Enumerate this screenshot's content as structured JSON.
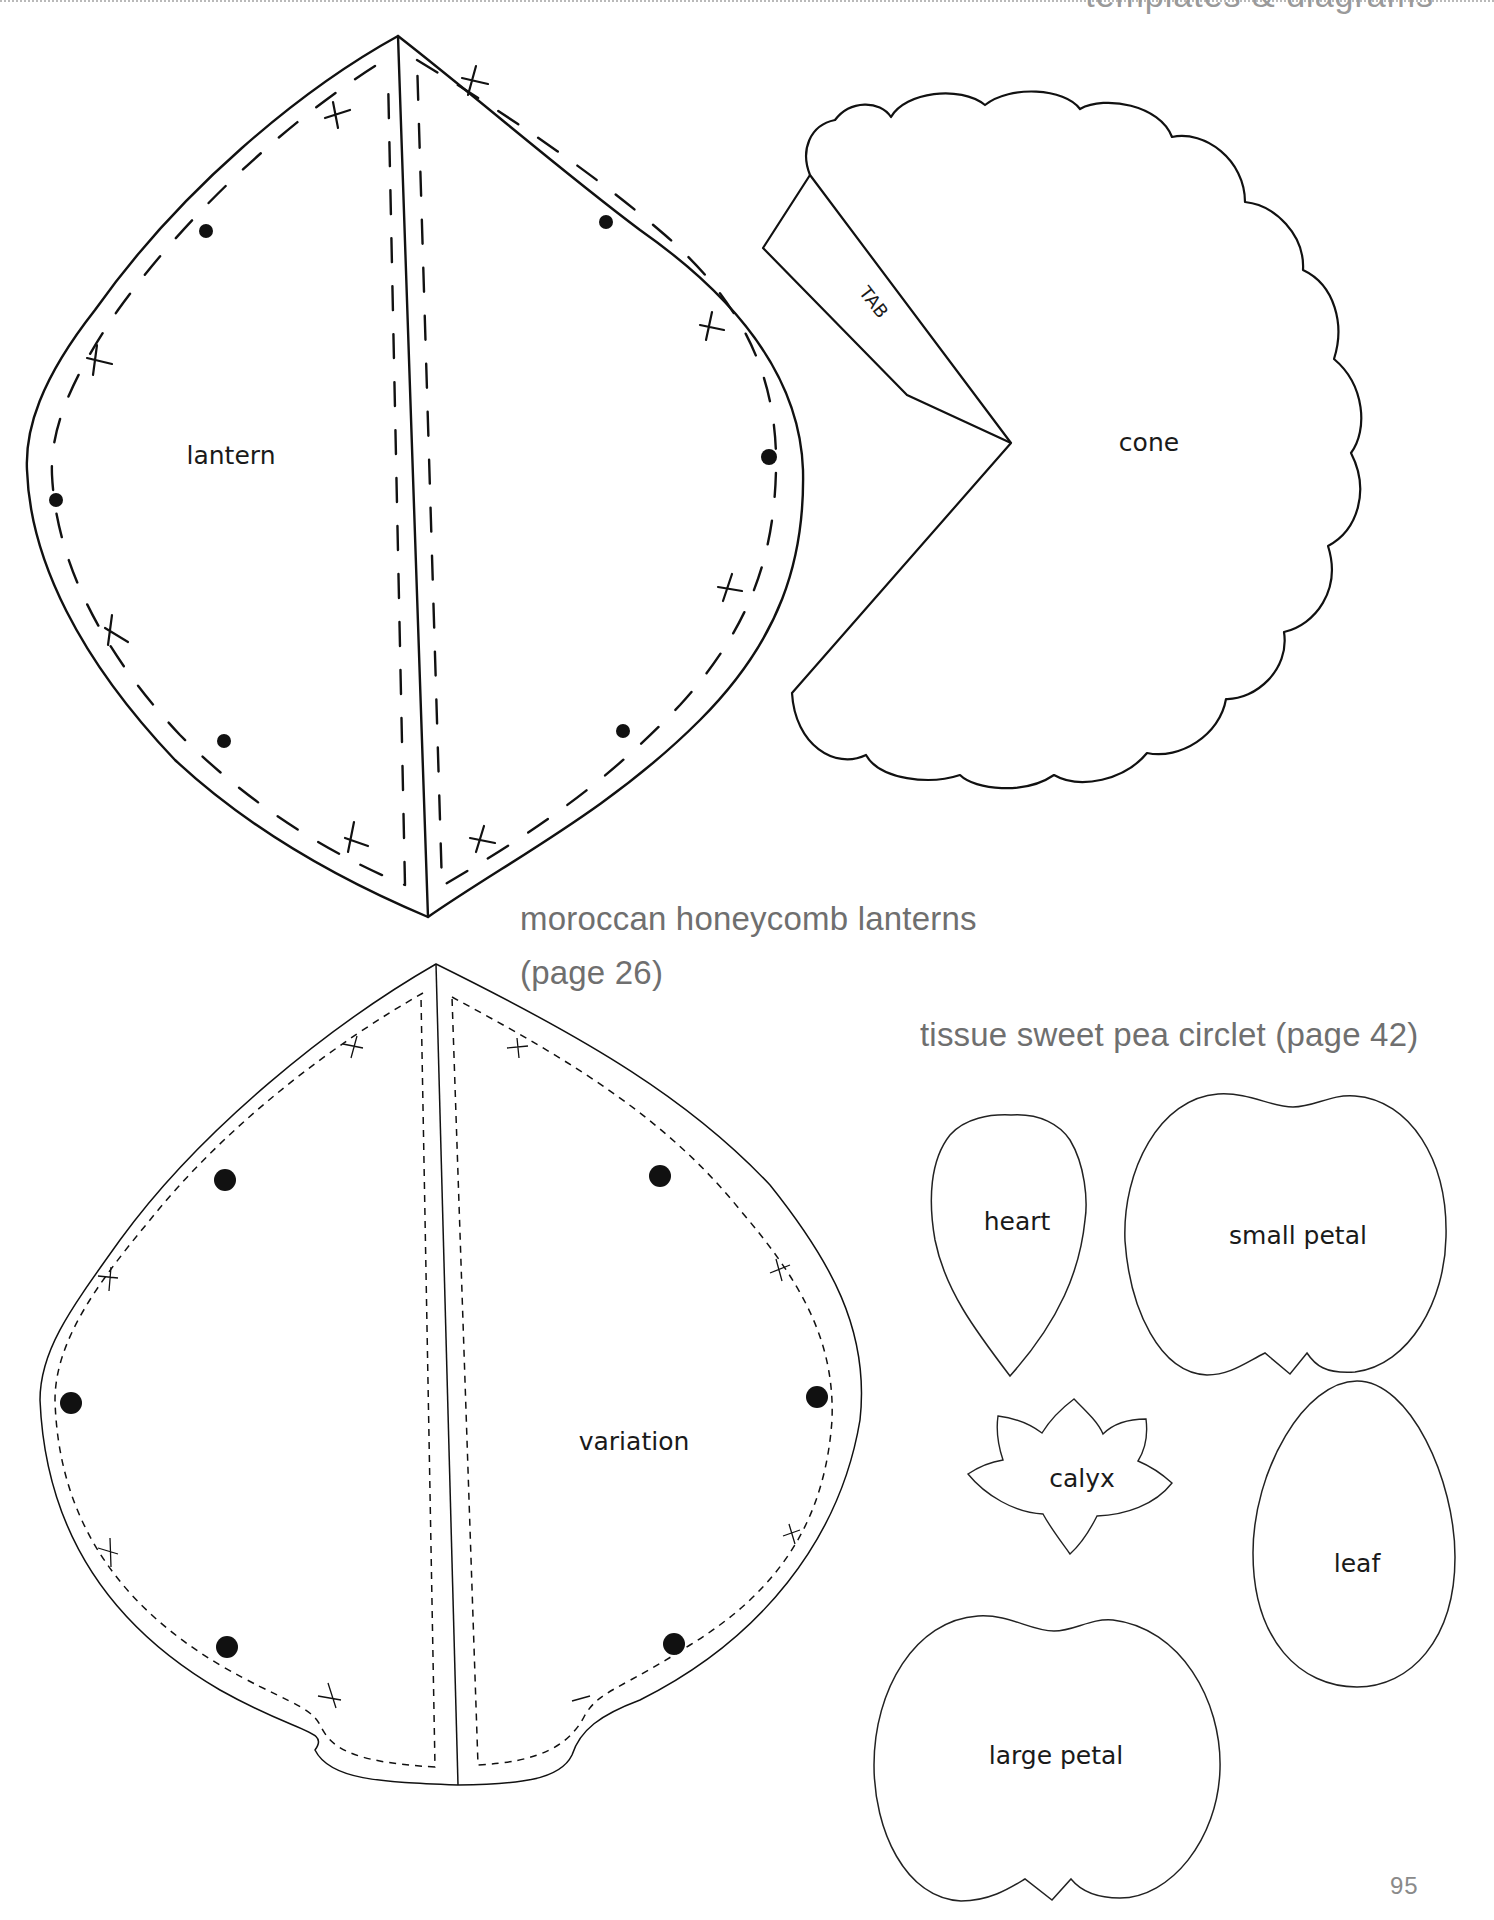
{
  "page": {
    "running_header": "templates & diagrams",
    "page_number": "95"
  },
  "sections": {
    "lanterns": {
      "title_line1": "moroccan honeycomb lanterns",
      "title_line2": "(page 26)"
    },
    "sweet_pea": {
      "title": "tissue sweet pea circlet (page 42)"
    }
  },
  "templates": {
    "lantern": {
      "label": "lantern"
    },
    "cone": {
      "label": "cone",
      "tab_label": "TAB"
    },
    "variation": {
      "label": "variation"
    },
    "heart": {
      "label": "heart"
    },
    "small_petal": {
      "label": "small petal"
    },
    "calyx": {
      "label": "calyx"
    },
    "leaf": {
      "label": "leaf"
    },
    "large_petal": {
      "label": "large petal"
    }
  },
  "colors": {
    "outline": "#111111",
    "heading_text": "#6f6f6f",
    "label_text": "#1a1a1a",
    "page_number": "#8a8a8a"
  }
}
